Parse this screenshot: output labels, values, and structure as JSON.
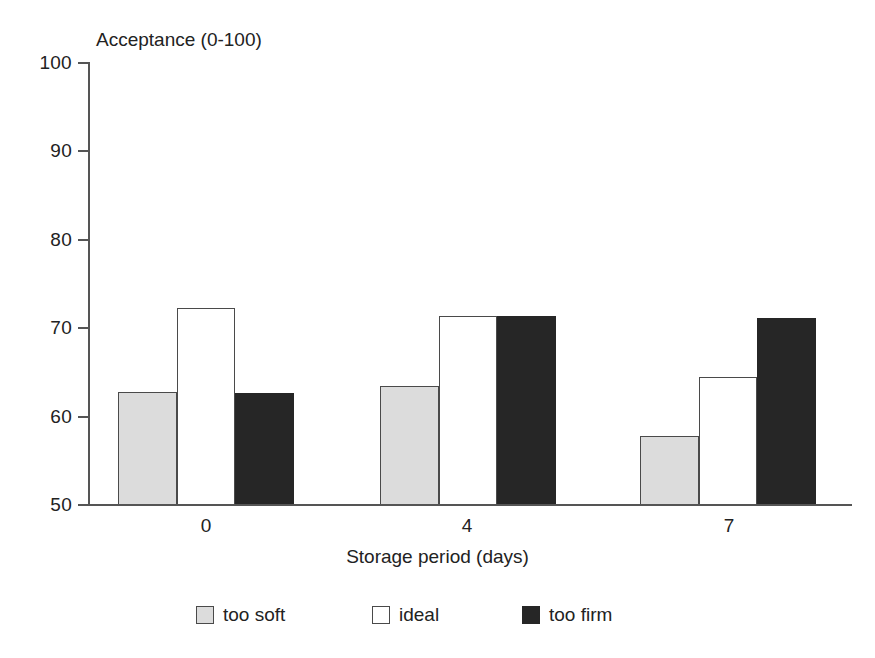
{
  "chart_data": {
    "type": "bar",
    "title": "",
    "subtitle": "",
    "xlabel": "Storage period (days)",
    "ylabel": "Acceptance (0-100)",
    "categories": [
      "0",
      "4",
      "7"
    ],
    "series": [
      {
        "name": "too soft",
        "color": "#dcdcdc",
        "values": [
          62.7,
          63.4,
          57.8
        ]
      },
      {
        "name": "ideal",
        "color": "#ffffff",
        "values": [
          72.2,
          71.3,
          64.4
        ]
      },
      {
        "name": "too firm",
        "color": "#262626",
        "values": [
          62.6,
          71.3,
          71.1
        ]
      }
    ],
    "ylim": [
      50,
      100
    ],
    "yticks": [
      50,
      60,
      70,
      80,
      90,
      100
    ],
    "ytick_labels": [
      "50",
      "60",
      "70",
      "80",
      "90",
      "100"
    ],
    "grid": false,
    "legend_position": "bottom",
    "annotations": []
  },
  "axes": {
    "y_title": "Acceptance (0-100)",
    "x_title": "Storage period (days)",
    "y_ticks": [
      "100",
      "90",
      "80",
      "70",
      "60",
      "50"
    ],
    "x_ticks": [
      "0",
      "4",
      "7"
    ]
  },
  "legend": {
    "items": [
      {
        "label": "too soft"
      },
      {
        "label": "ideal"
      },
      {
        "label": "too firm"
      }
    ]
  },
  "colors": {
    "too_soft": "#dcdcdc",
    "ideal": "#ffffff",
    "too_firm": "#262626",
    "axis": "#555555",
    "text": "#222222"
  }
}
